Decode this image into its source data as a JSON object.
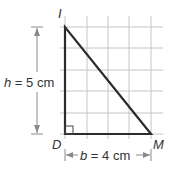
{
  "figure": {
    "vertices": {
      "top": "I",
      "bottom_left": "D",
      "bottom_right": "M"
    },
    "height_label": {
      "var": "h",
      "eq": " = 5 cm"
    },
    "base_label": {
      "var": "b",
      "eq": " = 4 cm"
    },
    "grid": {
      "columns": 4,
      "rows": 5,
      "unit": "cm"
    },
    "colors": {
      "grid": "#bdbdbd",
      "triangle": "#2b2b2b",
      "dimension": "#8a8a8a",
      "text": "#333333"
    }
  }
}
